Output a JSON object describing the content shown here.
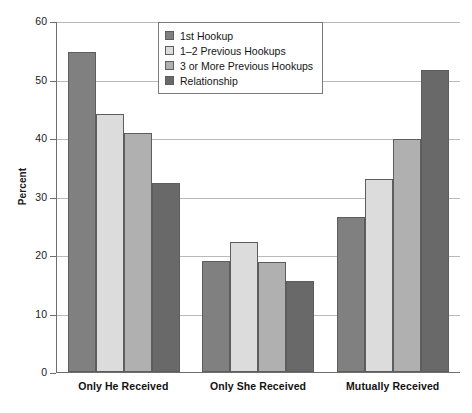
{
  "chart_data": {
    "type": "bar",
    "title": "",
    "xlabel": "",
    "ylabel": "Percent",
    "ylim": [
      0,
      60
    ],
    "ytick_values": [
      0,
      10,
      20,
      30,
      40,
      50,
      60
    ],
    "ytick_labels": [
      "0",
      "10",
      "20",
      "30",
      "40",
      "50",
      "60"
    ],
    "grid": true,
    "legend_position": "top-center",
    "categories": [
      "Only He Received",
      "Only She Received",
      "Mutually Received"
    ],
    "series": [
      {
        "name": "1st Hookup",
        "color": "#808080",
        "values": [
          54.7,
          18.9,
          26.5
        ]
      },
      {
        "name": "1–2 Previous Hookups",
        "color": "#dcdcdc",
        "values": [
          44.1,
          22.2,
          33.0
        ]
      },
      {
        "name": "3 or More Previous Hookups",
        "color": "#b0b0b0",
        "values": [
          40.8,
          18.8,
          39.9
        ]
      },
      {
        "name": "Relationship",
        "color": "#696969",
        "values": [
          32.3,
          15.6,
          51.6
        ]
      }
    ]
  }
}
